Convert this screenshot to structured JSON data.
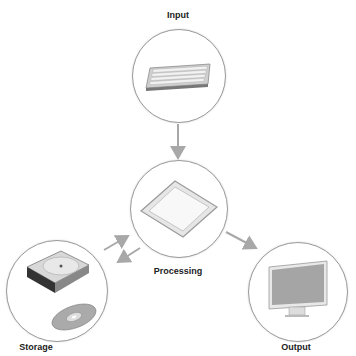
{
  "diagram": {
    "nodes": [
      {
        "id": "input",
        "label": "Input",
        "icon": "keyboard-icon"
      },
      {
        "id": "processing",
        "label": "Processing",
        "icon": "cpu-chip-icon"
      },
      {
        "id": "storage",
        "label": "Storage",
        "icon": "hard-drive-and-disc-icon"
      },
      {
        "id": "output",
        "label": "Output",
        "icon": "monitor-icon"
      }
    ],
    "edges": [
      {
        "from": "input",
        "to": "processing"
      },
      {
        "from": "processing",
        "to": "output"
      },
      {
        "from": "storage",
        "to": "processing"
      },
      {
        "from": "processing",
        "to": "storage"
      }
    ],
    "colors": {
      "arrow": "#a8a8a8",
      "circle_border": "#9a9a9a",
      "label": "#222222"
    }
  }
}
